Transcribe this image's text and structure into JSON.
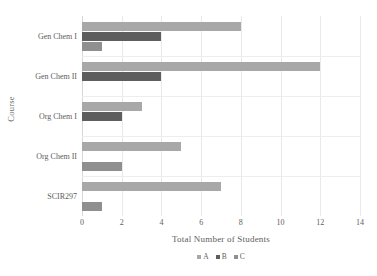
{
  "chart_data": {
    "type": "bar",
    "orientation": "horizontal",
    "title": "",
    "xlabel": "Total Number of Students",
    "ylabel": "Course",
    "categories": [
      "Gen Chem I",
      "Gen Chem II",
      "Org Chem I",
      "Org Chem II",
      "SCIR297"
    ],
    "series": [
      {
        "name": "A",
        "values": [
          8,
          12,
          3,
          5,
          7
        ],
        "color": "#a8a8a8"
      },
      {
        "name": "B",
        "values": [
          4,
          4,
          2,
          0,
          0
        ],
        "color": "#5e5e5e"
      },
      {
        "name": "C",
        "values": [
          1,
          0,
          0,
          2,
          1
        ],
        "color": "#8f8f8f"
      }
    ],
    "xlim": [
      0,
      14
    ],
    "xticks": [
      0,
      2,
      4,
      6,
      8,
      10,
      12,
      14
    ],
    "xtick_labels": [
      "0",
      "2",
      "4",
      "6",
      "8",
      "10",
      "12",
      "14"
    ],
    "grid": true,
    "legend_position": "bottom-center",
    "background": "#ffffff",
    "grid_color": "#e9e9e9",
    "text_color": "#5d5d5d"
  }
}
